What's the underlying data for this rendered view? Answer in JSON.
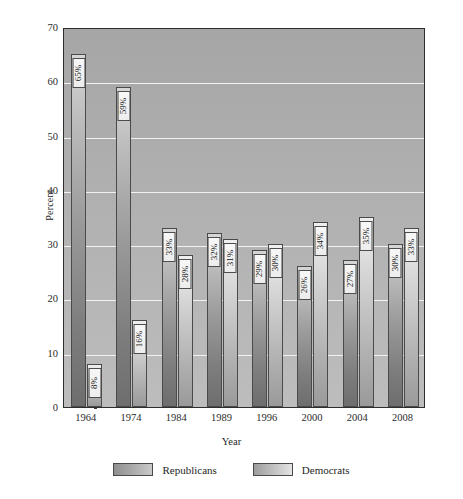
{
  "chart_data": {
    "type": "bar",
    "title": "",
    "xlabel": "Year",
    "ylabel": "Percent",
    "ylim": [
      0,
      70
    ],
    "ytick_step": 10,
    "yticks": [
      70,
      60,
      50,
      40,
      30,
      20,
      10,
      0
    ],
    "grid": true,
    "grid_color": "#f2f2f2",
    "legend_position": "bottom-center",
    "categories": [
      "1964",
      "1974",
      "1984",
      "1989",
      "1996",
      "2000",
      "2004",
      "2008"
    ],
    "series": [
      {
        "name": "Republicans",
        "color": "#9a9a9a",
        "values": [
          65,
          59,
          33,
          32,
          29,
          26,
          27,
          30
        ],
        "labels": [
          "65%",
          "59%",
          "33%",
          "32%",
          "29%",
          "26%",
          "27%",
          "30%"
        ]
      },
      {
        "name": "Democrats",
        "color": "#c3c3c3",
        "values": [
          8,
          16,
          28,
          31,
          30,
          34,
          35,
          33
        ],
        "labels": [
          "8%",
          "16%",
          "28%",
          "31%",
          "30%",
          "34%",
          "35%",
          "33%"
        ]
      }
    ]
  },
  "axes": {
    "y_title": "Percent",
    "x_title": "Year"
  },
  "legend": {
    "items": [
      {
        "label": "Republicans",
        "swatch": "rep"
      },
      {
        "label": "Democrats",
        "swatch": "dem"
      }
    ]
  }
}
